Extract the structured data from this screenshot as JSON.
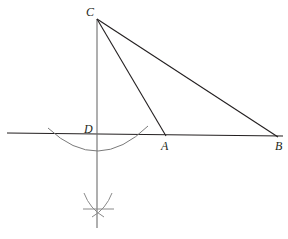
{
  "figure": {
    "background_color": "#ffffff",
    "stroke_color": "#231f20",
    "arc_color": "#6f6f6f",
    "width": 288,
    "height": 239,
    "points": {
      "C": {
        "label": "C",
        "x": 97,
        "y": 19,
        "label_x": 86,
        "label_y": 16
      },
      "D": {
        "label": "D",
        "x": 97,
        "y": 134,
        "label_x": 84,
        "label_y": 133
      },
      "A": {
        "label": "A",
        "x": 165,
        "y": 134,
        "label_x": 161,
        "label_y": 150
      },
      "B": {
        "label": "B",
        "x": 277,
        "y": 136,
        "label_x": 275,
        "label_y": 150
      }
    },
    "segments": [
      {
        "name": "baseline-AB",
        "d": "M 7 133 L 283 136"
      },
      {
        "name": "vertical-CD",
        "d": "M 97 19 L 97 228"
      },
      {
        "name": "segment-CA",
        "d": "M 97 19 L 166 136"
      },
      {
        "name": "segment-CB",
        "d": "M 97 19 L 278 137"
      }
    ],
    "arcs": [
      {
        "name": "upper-compass-arc",
        "d": "M 48 128 Q 98 175 148 126"
      },
      {
        "name": "lower-compass-arc-left",
        "d": "M 84 193 Q 90 210 103 216"
      },
      {
        "name": "lower-compass-arc-right",
        "d": "M 112 193 Q 106 210 92 216"
      },
      {
        "name": "lower-intersection-tick",
        "d": "M 83 209 L 114 209"
      }
    ],
    "watermark": {
      "text": "",
      "x": 24,
      "y": 62
    }
  }
}
